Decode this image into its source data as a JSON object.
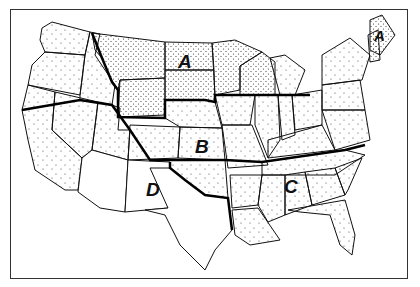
{
  "map": {
    "title": "",
    "frame": true,
    "regions": [
      {
        "id": "A",
        "label": "A",
        "description": "Northern Plains / Upper Midwest (MT, WY, ND, SD, MN, WI)",
        "fill": "dense-stipple",
        "label_pos": [
          186,
          60
        ]
      },
      {
        "id": "A2",
        "label": "A",
        "description": "Northern New England (NH area)",
        "fill": "dense-stipple",
        "label_pos": [
          378,
          38
        ]
      },
      {
        "id": "B",
        "label": "B",
        "description": "Central Plains (NE, KS, OK)",
        "fill": "light-stipple",
        "label_pos": [
          201,
          145
        ]
      },
      {
        "id": "C",
        "label": "C",
        "description": "Southeast (AL area)",
        "fill": "light-stipple",
        "label_pos": [
          290,
          185
        ]
      },
      {
        "id": "D",
        "label": "D",
        "description": "Southwest (AZ, NM, TX)",
        "fill": "none",
        "label_pos": [
          146,
          188
        ]
      }
    ],
    "colors": {
      "line": "#111111",
      "background": "#ffffff",
      "dots": "#333333"
    }
  }
}
